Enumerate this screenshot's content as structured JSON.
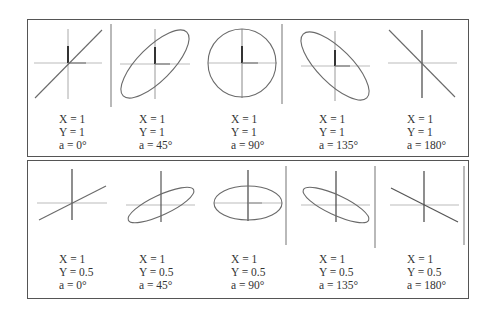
{
  "rows": [
    {
      "name": "top",
      "figures": [
        {
          "x_label": "X = 1",
          "y_label": "Y = 1",
          "a_label": "a = 0°",
          "shape": "line",
          "cx": 68,
          "cy": 63,
          "lx": 59,
          "ly": 115
        },
        {
          "x_label": "X = 1",
          "y_label": "Y = 1",
          "a_label": "a = 45°",
          "shape": "ellipse",
          "cx": 155,
          "cy": 64,
          "lx": 139,
          "ly": 115
        },
        {
          "x_label": "X = 1",
          "y_label": "Y = 1",
          "a_label": "a = 90°",
          "shape": "circle",
          "cx": 242,
          "cy": 63,
          "lx": 231,
          "ly": 115
        },
        {
          "x_label": "X = 1",
          "y_label": "Y = 1",
          "a_label": "a = 135°",
          "shape": "ellipse",
          "cx": 335,
          "cy": 66,
          "lx": 319,
          "ly": 115
        },
        {
          "x_label": "X = 1",
          "y_label": "Y = 1",
          "a_label": "a = 180°",
          "shape": "line",
          "cx": 422,
          "cy": 63,
          "lx": 407,
          "ly": 115
        }
      ]
    },
    {
      "name": "bottom",
      "figures": [
        {
          "x_label": "X = 1",
          "y_label": "Y = 0.5",
          "a_label": "a = 0°",
          "shape": "line",
          "cx": 72,
          "cy": 203,
          "lx": 59,
          "ly": 255
        },
        {
          "x_label": "X = 1",
          "y_label": "Y = 0.5",
          "a_label": "a = 45°",
          "shape": "ellipse",
          "cx": 161,
          "cy": 205,
          "lx": 139,
          "ly": 255
        },
        {
          "x_label": "X = 1",
          "y_label": "Y = 0.5",
          "a_label": "a = 90°",
          "shape": "ellipse",
          "cx": 248,
          "cy": 203,
          "lx": 231,
          "ly": 255
        },
        {
          "x_label": "X = 1",
          "y_label": "Y = 0.5",
          "a_label": "a = 135°",
          "shape": "ellipse",
          "cx": 336,
          "cy": 205,
          "lx": 319,
          "ly": 255
        },
        {
          "x_label": "X = 1",
          "y_label": "Y = 0.5",
          "a_label": "a = 180°",
          "shape": "line",
          "cx": 424,
          "cy": 205,
          "lx": 407,
          "ly": 255
        }
      ]
    }
  ],
  "colors": {
    "border": "#555555",
    "axis_horizontal": "#b5b5b5",
    "axis_vertical": "#555555",
    "curve": "#6a6a6a",
    "divider": "#888888",
    "text": "#333333"
  }
}
